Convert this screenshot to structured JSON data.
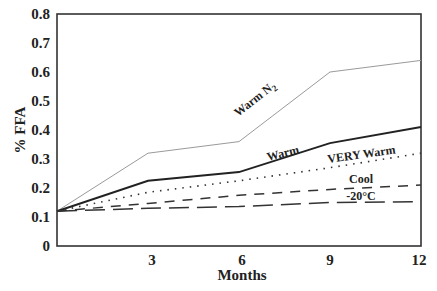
{
  "chart_data": {
    "type": "line",
    "title": "",
    "xlabel": "Months",
    "ylabel": "% FFA",
    "xlim": [
      0,
      12
    ],
    "ylim": [
      0,
      0.8
    ],
    "x_ticks": [
      "3",
      "6",
      "9",
      "12"
    ],
    "y_ticks": [
      "0",
      "0.1",
      "0.2",
      "0.3",
      "0.4",
      "0.5",
      "0.6",
      "0.7",
      "0.8"
    ],
    "grid": false,
    "legend": "inline labels",
    "x": [
      0,
      3,
      6,
      9,
      12
    ],
    "series": [
      {
        "name": "Warm N2",
        "label_main": "Warm N",
        "label_sub": "2",
        "style": "thin-gray",
        "values": [
          0.12,
          0.32,
          0.36,
          0.6,
          0.64
        ]
      },
      {
        "name": "Warm",
        "label_main": "Warm",
        "style": "solid",
        "values": [
          0.12,
          0.225,
          0.255,
          0.355,
          0.41
        ]
      },
      {
        "name": "VERY Warm",
        "label_main": "VERY Warm",
        "style": "dotted",
        "values": [
          0.12,
          0.185,
          0.225,
          0.27,
          0.32
        ]
      },
      {
        "name": "Cool",
        "label_main": "Cool",
        "style": "short-dash",
        "values": [
          0.12,
          0.147,
          0.175,
          0.195,
          0.21
        ]
      },
      {
        "name": "-20°C",
        "label_main": "-20°C",
        "style": "long-dash",
        "values": [
          0.12,
          0.13,
          0.136,
          0.15,
          0.153
        ]
      }
    ]
  }
}
